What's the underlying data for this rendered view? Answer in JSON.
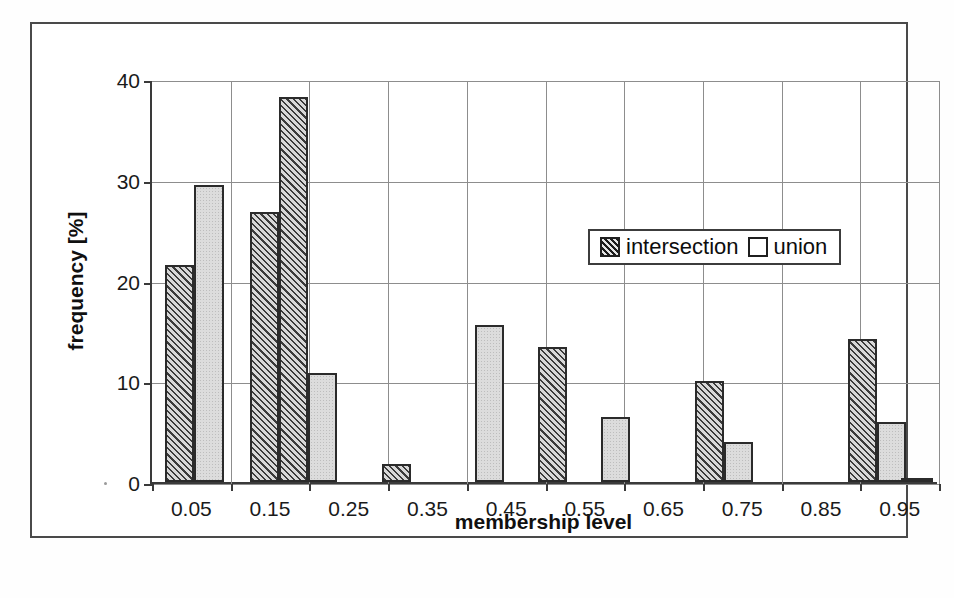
{
  "figure": {
    "caption_fragment": ""
  },
  "legend": {
    "position": "inside-top-center",
    "entries": [
      {
        "label": "intersection",
        "swatch": "hatched-diagonal",
        "color": "#3b3b3b"
      },
      {
        "label": "union",
        "swatch": "open-white",
        "color": "#ffffff"
      }
    ]
  },
  "axes": {
    "y": {
      "title": "frequency [%]",
      "ticks": [
        "0",
        "10",
        "20",
        "30",
        "40"
      ],
      "min": 0,
      "max": 40
    },
    "x": {
      "title": "membership level",
      "ticks": [
        "0.05",
        "0.15",
        "0.25",
        "0.35",
        "0.45",
        "0.55",
        "0.65",
        "0.75",
        "0.85",
        "0.95"
      ]
    }
  },
  "chart_data": {
    "type": "bar",
    "title": "",
    "xlabel": "membership level",
    "ylabel": "frequency [%]",
    "categories": [
      "0.05",
      "0.15",
      "0.25",
      "0.35",
      "0.45",
      "0.55",
      "0.65",
      "0.75",
      "0.85",
      "0.95"
    ],
    "ylim": [
      0,
      40
    ],
    "yticks": [
      0,
      10,
      20,
      30,
      40
    ],
    "grid": "both",
    "legend_position": "upper center inside",
    "series": [
      {
        "name": "intersection",
        "fill": "diagonal-hatch",
        "values": [
          21.5,
          38.2,
          1.8,
          13.4,
          0,
          10.0,
          0,
          14.2,
          0,
          0.3
        ]
      },
      {
        "name": "union",
        "fill": "light-stipple",
        "values": [
          29.5,
          10.8,
          0,
          0,
          6.5,
          4.0,
          0,
          6.0,
          0,
          0
        ]
      }
    ],
    "bars": [
      {
        "series": "intersection",
        "bin": "0.05",
        "value": 21.5,
        "x_frac": 0.017,
        "width_frac": 0.037
      },
      {
        "series": "union",
        "bin": "0.05",
        "value": 29.5,
        "x_frac": 0.054,
        "width_frac": 0.037
      },
      {
        "series": "intersection",
        "bin": "0.15",
        "value": 26.8,
        "x_frac": 0.124,
        "width_frac": 0.037
      },
      {
        "series": "intersection",
        "bin": "0.15",
        "value": 38.2,
        "x_frac": 0.161,
        "width_frac": 0.037
      },
      {
        "series": "union",
        "bin": "0.15",
        "value": 10.8,
        "x_frac": 0.198,
        "width_frac": 0.037
      },
      {
        "series": "intersection",
        "bin": "0.25",
        "value": 1.8,
        "x_frac": 0.292,
        "width_frac": 0.037
      },
      {
        "series": "union",
        "bin": "0.35",
        "value": 15.6,
        "x_frac": 0.41,
        "width_frac": 0.037
      },
      {
        "series": "intersection",
        "bin": "0.35",
        "value": 13.4,
        "x_frac": 0.49,
        "width_frac": 0.037
      },
      {
        "series": "union",
        "bin": "0.45",
        "value": 6.5,
        "x_frac": 0.57,
        "width_frac": 0.037
      },
      {
        "series": "intersection",
        "bin": "0.55",
        "value": 10.0,
        "x_frac": 0.69,
        "width_frac": 0.037
      },
      {
        "series": "union",
        "bin": "0.65",
        "value": 4.0,
        "x_frac": 0.727,
        "width_frac": 0.037
      },
      {
        "series": "intersection",
        "bin": "0.75",
        "value": 14.2,
        "x_frac": 0.884,
        "width_frac": 0.037
      },
      {
        "series": "union",
        "bin": "0.85",
        "value": 6.0,
        "x_frac": 0.921,
        "width_frac": 0.037
      },
      {
        "series": "intersection",
        "bin": "0.95",
        "value": 0.3,
        "x_frac": 0.952,
        "width_frac": 0.04
      }
    ]
  }
}
